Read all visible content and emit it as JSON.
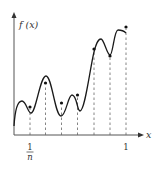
{
  "diagram": {
    "y_axis_label": "f (x)",
    "x_axis_label": "x",
    "tick_left_numerator": "1",
    "tick_left_denominator": "n",
    "tick_right": "1",
    "colors": {
      "curve": "#1a1a1a",
      "axis": "#555555",
      "dashed": "#666666",
      "dot": "#111111"
    },
    "partition_points": [
      30,
      45.5,
      61.5,
      77.5,
      94,
      110,
      126
    ],
    "sample_dots": [
      {
        "x": 30,
        "y": 107
      },
      {
        "x": 45.5,
        "y": 83
      },
      {
        "x": 61.5,
        "y": 103
      },
      {
        "x": 77.5,
        "y": 95
      },
      {
        "x": 94,
        "y": 49
      },
      {
        "x": 110,
        "y": 56
      },
      {
        "x": 126,
        "y": 27
      }
    ]
  }
}
